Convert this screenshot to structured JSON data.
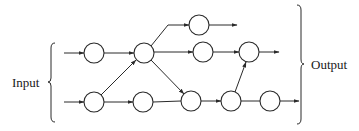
{
  "diagram": {
    "type": "network-flow",
    "labels": {
      "input": "Input",
      "output": "Output"
    },
    "nodes": [
      {
        "id": "n1",
        "row": "upper-input",
        "x": 94,
        "y": 53
      },
      {
        "id": "n2",
        "row": "hub",
        "x": 144,
        "y": 53
      },
      {
        "id": "n3",
        "row": "lower-input",
        "x": 94,
        "y": 102
      },
      {
        "id": "n4",
        "row": "lower",
        "x": 143,
        "y": 102
      },
      {
        "id": "n5",
        "row": "top",
        "x": 199,
        "y": 25
      },
      {
        "id": "n6",
        "row": "middle",
        "x": 203,
        "y": 52
      },
      {
        "id": "n7",
        "row": "middle-right",
        "x": 249,
        "y": 52
      },
      {
        "id": "n8",
        "row": "lower",
        "x": 191,
        "y": 101
      },
      {
        "id": "n9",
        "row": "lower",
        "x": 231,
        "y": 101
      },
      {
        "id": "n10",
        "row": "lower",
        "x": 270,
        "y": 101
      }
    ],
    "edges": [
      {
        "from": "input",
        "to": "n1"
      },
      {
        "from": "input",
        "to": "n3"
      },
      {
        "from": "n1",
        "to": "n2"
      },
      {
        "from": "n3",
        "to": "n2"
      },
      {
        "from": "n3",
        "to": "n4"
      },
      {
        "from": "n2",
        "to": "n5"
      },
      {
        "from": "n2",
        "to": "n6"
      },
      {
        "from": "n2",
        "to": "n8"
      },
      {
        "from": "n4",
        "to": "n8"
      },
      {
        "from": "n6",
        "to": "n7"
      },
      {
        "from": "n8",
        "to": "n9"
      },
      {
        "from": "n9",
        "to": "n7"
      },
      {
        "from": "n9",
        "to": "n10"
      },
      {
        "from": "n5",
        "to": "output"
      },
      {
        "from": "n7",
        "to": "output"
      },
      {
        "from": "n10",
        "to": "output"
      }
    ]
  }
}
